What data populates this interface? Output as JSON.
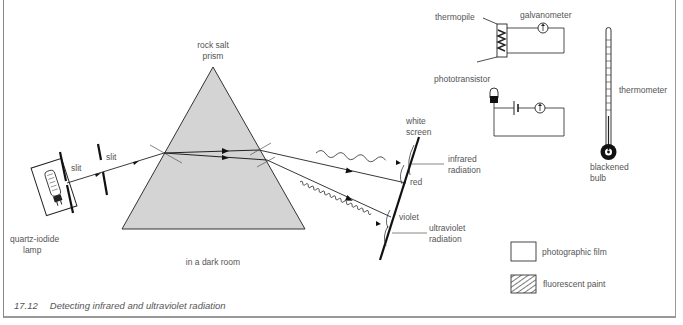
{
  "figure": {
    "number": "17.12",
    "caption": "Detecting infrared and ultraviolet radiation"
  },
  "labels": {
    "lamp": [
      "quartz-iodide",
      "lamp"
    ],
    "slit1": "slit",
    "slit2": "slit",
    "prism": [
      "rock salt",
      "prism"
    ],
    "room": "in a dark room",
    "screen": [
      "white",
      "screen"
    ],
    "infrared": [
      "infrared",
      "radiation"
    ],
    "red": "red",
    "violet": "violet",
    "ultraviolet": [
      "ultraviolet",
      "radiation"
    ],
    "thermopile": "thermopile",
    "galvanometer": "galvanometer",
    "phototransistor": "phototransistor",
    "thermometer": "thermometer",
    "bulb": [
      "blackened",
      "bulb"
    ]
  },
  "legend": {
    "items": [
      {
        "label": "photographic film",
        "pattern": "plain"
      },
      {
        "label": "fluorescent paint",
        "pattern": "hatched"
      }
    ]
  },
  "colors": {
    "prism_fill": "#d4d4d4",
    "line": "#222222",
    "text": "#555555"
  }
}
